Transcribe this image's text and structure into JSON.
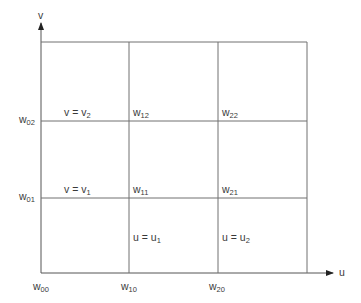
{
  "axes": {
    "u_label": "u",
    "v_label": "v"
  },
  "grid": {
    "x_lines": [
      41,
      129,
      218,
      307
    ],
    "y_lines": [
      42,
      121,
      198,
      273
    ],
    "line_color": "#707070"
  },
  "corner_labels": [
    {
      "base": "w",
      "sub": "00"
    },
    {
      "base": "w",
      "sub": "10"
    },
    {
      "base": "w",
      "sub": "20"
    },
    {
      "base": "w",
      "sub": "01"
    },
    {
      "base": "w",
      "sub": "02"
    }
  ],
  "node_labels": [
    {
      "base": "w",
      "sub": "11"
    },
    {
      "base": "w",
      "sub": "21"
    },
    {
      "base": "w",
      "sub": "12"
    },
    {
      "base": "w",
      "sub": "22"
    }
  ],
  "curve_labels": [
    {
      "lhs": "v = v",
      "sub": "1"
    },
    {
      "lhs": "v = v",
      "sub": "2"
    },
    {
      "lhs": "u = u",
      "sub": "1"
    },
    {
      "lhs": "u = u",
      "sub": "2"
    }
  ]
}
